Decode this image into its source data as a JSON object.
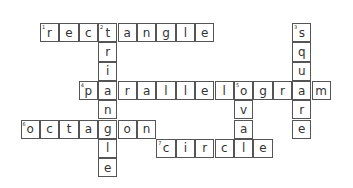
{
  "puzzle": {
    "origin": {
      "x": 20.5,
      "y": 23
    },
    "cell_size": {
      "w": 19.4,
      "h": 19.3
    },
    "words": [
      {
        "number": 1,
        "answer": "rectangle",
        "direction": "across",
        "row": 0,
        "col": 1
      },
      {
        "number": 2,
        "answer": "triangle",
        "direction": "down",
        "row": 0,
        "col": 4
      },
      {
        "number": 3,
        "answer": "square",
        "direction": "down",
        "row": 0,
        "col": 14
      },
      {
        "number": 4,
        "answer": "parallelogram",
        "direction": "across",
        "row": 3,
        "col": 3
      },
      {
        "number": 5,
        "answer": "oval",
        "direction": "down",
        "row": 3,
        "col": 11
      },
      {
        "number": 6,
        "answer": "octagon",
        "direction": "across",
        "row": 5,
        "col": 0
      },
      {
        "number": 7,
        "answer": "circle",
        "direction": "across",
        "row": 6,
        "col": 7
      }
    ]
  }
}
